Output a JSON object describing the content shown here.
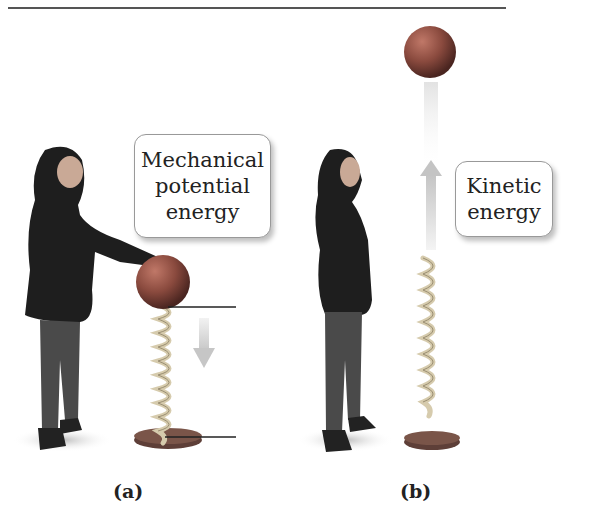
{
  "figure": {
    "panels": [
      {
        "id": "a",
        "label": "(a)",
        "annotation_lines": [
          "Mechanical",
          "potential",
          "energy"
        ],
        "description": "Woman pressing ball down on compressed spring; downward arrow; horizontal reference lines at ball bottom and spring base"
      },
      {
        "id": "b",
        "label": "(b)",
        "annotation_lines": [
          "Kinetic",
          "energy"
        ],
        "description": "Woman looking up at ball launched upward from extended spring; upward arrow"
      }
    ],
    "colors": {
      "ball": "#8a4a3e",
      "spring": "#d8cdb0",
      "base": "#6b4a42",
      "arrow": "#d4d4d4",
      "border": "#999999",
      "rule": "#555555"
    }
  }
}
